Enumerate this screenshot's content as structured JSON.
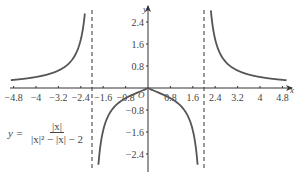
{
  "chart_data": {
    "type": "line",
    "title": "",
    "function": "y = |x| / (|x|^2 - |x| - 2)",
    "xlabel": "x",
    "ylabel": "y",
    "origin_label": "O",
    "xlim": [
      -5.0,
      5.1
    ],
    "ylim": [
      -2.8,
      2.6
    ],
    "x_ticks": [
      -4.8,
      -4,
      -3.2,
      -2.4,
      -1.6,
      -0.8,
      0.8,
      1.6,
      2.4,
      3.2,
      4,
      4.8
    ],
    "x_tick_labels": [
      "-4.8",
      "-4",
      "-3.2",
      "-2.4",
      "-1.6",
      "-0.8",
      "0.8",
      "1.6",
      "2.4",
      "3.2",
      "4",
      "4.8"
    ],
    "y_ticks": [
      2.4,
      1.6,
      0.8,
      -0.8,
      -1.6,
      -2.4
    ],
    "y_tick_labels": [
      "2.4",
      "1.6",
      "0.8",
      "-0.8",
      "-1.6",
      "-2.4"
    ],
    "vertical_asymptotes": [
      -2,
      2
    ],
    "asymptote_style": "dashed",
    "grid": false,
    "legend": null,
    "series": [
      {
        "name": "y = |x|/(|x|²-|x|-2)",
        "branch": "left outer",
        "x": [
          -4.9,
          -4,
          -3.2,
          -2.4,
          -2.15
        ],
        "y": [
          0.27,
          0.4,
          0.63,
          1.5,
          4.3
        ]
      },
      {
        "name": "y = |x|/(|x|²-|x|-2)",
        "branch": "middle",
        "x": [
          -1.9,
          -1.6,
          -0.8,
          0,
          0.8,
          1.6,
          1.9
        ],
        "y": [
          -6.8,
          -1.43,
          -0.29,
          0,
          -0.29,
          -1.43,
          -6.8
        ]
      },
      {
        "name": "y = |x|/(|x|²-|x|-2)",
        "branch": "right outer",
        "x": [
          2.15,
          2.4,
          3.2,
          4,
          4.9
        ],
        "y": [
          4.3,
          1.5,
          0.63,
          0.4,
          0.27
        ]
      }
    ],
    "colors": {
      "curve": "#555555",
      "axis": "#333333",
      "asymptote": "#555555",
      "text": "#444444"
    }
  },
  "formula": {
    "lhs": "y =",
    "numerator": "|x|",
    "denominator": "|x|² − |x| − 2"
  }
}
